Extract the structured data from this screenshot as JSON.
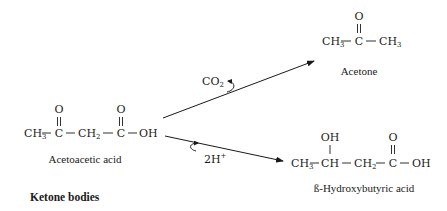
{
  "diagram": {
    "title": "Ketone bodies",
    "colors": {
      "ink": "#1a1a1a",
      "background": "#ffffff"
    },
    "nodes": {
      "acetoacetic_acid": {
        "name": "Acetoacetic acid",
        "formula": {
          "ch3": "CH",
          "ch3_sub": "3",
          "c1": "C",
          "o1": "O",
          "ch2": "CH",
          "ch2_sub": "2",
          "c2": "C",
          "o2": "O",
          "oh": "OH",
          "dash": "—"
        }
      },
      "acetone": {
        "name": "Acetone",
        "formula": {
          "ch3a": "CH",
          "ch3a_sub": "3",
          "c": "C",
          "o": "O",
          "ch3b": "CH",
          "ch3b_sub": "3"
        }
      },
      "beta_hydroxybutyric_acid": {
        "name": "ß-Hydroxybutyric acid",
        "formula": {
          "ch3": "CH",
          "ch3_sub": "3",
          "ch": "CH",
          "oh_top": "OH",
          "ch2": "CH",
          "ch2_sub": "2",
          "c": "C",
          "o": "O",
          "oh": "OH"
        }
      }
    },
    "edges": [
      {
        "from": "acetoacetic_acid",
        "to": "acetone",
        "byproduct": "CO",
        "byproduct_sub": "2"
      },
      {
        "from": "acetoacetic_acid",
        "to": "beta_hydroxybutyric_acid",
        "cofactor": "2H",
        "cofactor_sup": "+"
      }
    ]
  }
}
